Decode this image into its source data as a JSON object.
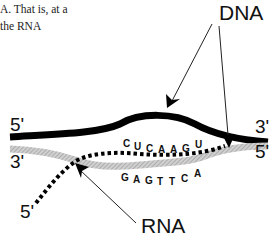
{
  "text_fragment": {
    "line1": "A. That is, at a",
    "line2": "the RNA"
  },
  "labels": {
    "dna": "DNA",
    "rna": "RNA"
  },
  "ends": {
    "top_left": "5'",
    "top_right": "3'",
    "bottom_left": "3'",
    "bottom_right": "5'",
    "rna_tail": "5'"
  },
  "sequences": {
    "rna_bases": [
      "C",
      "U",
      "C",
      "A",
      "A",
      "G",
      "U"
    ],
    "dna_template_bases": [
      "G",
      "A",
      "G",
      "T",
      "T",
      "C",
      "A"
    ]
  },
  "colors": {
    "coding_strand": "#000000",
    "template_strand": "#b5b5b5",
    "rna_strand": "#000000"
  }
}
